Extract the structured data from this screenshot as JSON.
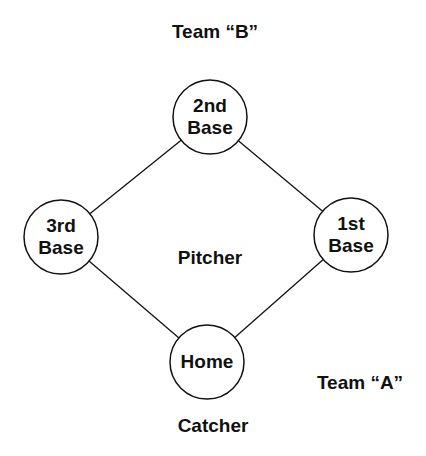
{
  "diagram": {
    "type": "baseball-field-positions",
    "labels": {
      "team_b": "Team “B”",
      "team_a": "Team “A”",
      "pitcher": "Pitcher",
      "catcher": "Catcher"
    },
    "bases": [
      {
        "id": "second",
        "line1": "2nd",
        "line2": "Base"
      },
      {
        "id": "third",
        "line1": "3rd",
        "line2": "Base"
      },
      {
        "id": "first",
        "line1": "1st",
        "line2": "Base"
      },
      {
        "id": "home",
        "line1": "Home",
        "line2": ""
      }
    ],
    "edges": [
      [
        "second",
        "third"
      ],
      [
        "second",
        "first"
      ],
      [
        "third",
        "home"
      ],
      [
        "first",
        "home"
      ]
    ],
    "colors": {
      "stroke": "#111111",
      "background": "#ffffff",
      "text": "#111111"
    }
  }
}
